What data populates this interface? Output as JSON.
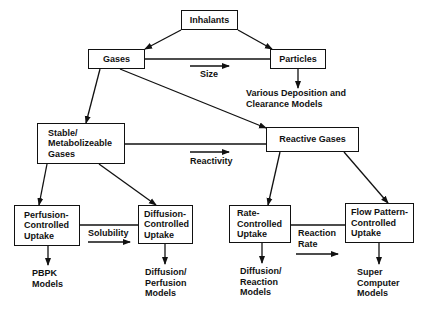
{
  "nodes": {
    "inhalants": "Inhalants",
    "gases": "Gases",
    "particles": "Particles",
    "stable": "Stable/\nMetabolizeable\nGases",
    "reactive": "Reactive Gases",
    "perfusion": "Perfusion-\nControlled\nUptake",
    "diffusion": "Diffusion-\nControlled\nUptake",
    "rate": "Rate-\nControlled\nUptake",
    "flow": "Flow Pattern-\nControlled\nUptake"
  },
  "axis_labels": {
    "size": "Size",
    "reactivity": "Reactivity",
    "solubility": "Solubility",
    "reaction_rate": "Reaction\nRate"
  },
  "outputs": {
    "deposition": "Various Deposition and\nClearance Models",
    "pbpk": "PBPK\nModels",
    "diffusion_perfusion": "Diffusion/\nPerfusion\nModels",
    "diffusion_reaction": "Diffusion/\nReaction\nModels",
    "super_computer": "Super\nComputer\nModels"
  }
}
